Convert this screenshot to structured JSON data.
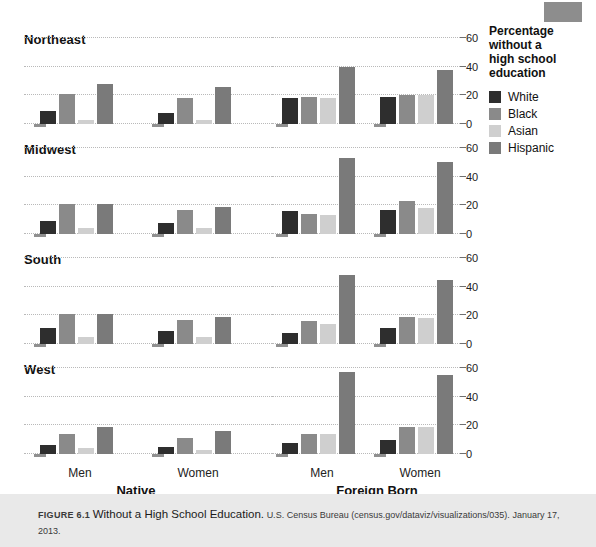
{
  "legend": {
    "title_lines": [
      "Percentage",
      "without a",
      "high school",
      "education"
    ],
    "items": [
      {
        "label": "White",
        "color": "#2e2e2e"
      },
      {
        "label": "Black",
        "color": "#8a8a8a"
      },
      {
        "label": "Asian",
        "color": "#cfcfcf"
      },
      {
        "label": "Hispanic",
        "color": "#7a7a7a"
      }
    ]
  },
  "caption": {
    "figure_number": "FIGURE 6.1",
    "title": "Without a High School Education.",
    "source": "U.S. Census Bureau (census.gov/dataviz/visualizations/035).",
    "date": "January 17, 2013."
  },
  "axis": {
    "ticks": [
      0,
      20,
      40,
      60
    ],
    "ymin": 0,
    "ymax": 60
  },
  "group_labels": {
    "native": "Native",
    "foreign": "Foreign Born",
    "men": "Men",
    "women": "Women"
  },
  "regions": [
    {
      "name": "Northeast"
    },
    {
      "name": "Midwest"
    },
    {
      "name": "South"
    },
    {
      "name": "West"
    }
  ],
  "chart_data": {
    "type": "bar",
    "title": "Without a High School Education",
    "subtitle": "Percentage without a high school education",
    "xlabel": "",
    "ylabel": "Percentage without a high school education",
    "ylim": [
      0,
      60
    ],
    "yticks": [
      0,
      20,
      40,
      60
    ],
    "grid": true,
    "legend_position": "right",
    "series_names": [
      "White",
      "Black",
      "Asian",
      "Hispanic"
    ],
    "series_colors": [
      "#2e2e2e",
      "#8a8a8a",
      "#cfcfcf",
      "#7a7a7a"
    ],
    "facet_rows": [
      "Northeast",
      "Midwest",
      "South",
      "West"
    ],
    "facet_cols": [
      "Native",
      "Foreign Born"
    ],
    "categories": [
      "Men",
      "Women"
    ],
    "panels": [
      {
        "region": "Northeast",
        "nativity": "Native",
        "groups": [
          {
            "category": "Men",
            "values": [
              9,
              21,
              3,
              28
            ]
          },
          {
            "category": "Women",
            "values": [
              8,
              18,
              3,
              26
            ]
          }
        ]
      },
      {
        "region": "Northeast",
        "nativity": "Foreign Born",
        "groups": [
          {
            "category": "Men",
            "values": [
              18,
              19,
              18,
              40
            ]
          },
          {
            "category": "Women",
            "values": [
              19,
              20,
              20,
              38
            ]
          }
        ]
      },
      {
        "region": "Midwest",
        "nativity": "Native",
        "groups": [
          {
            "category": "Men",
            "values": [
              9,
              21,
              4,
              21
            ]
          },
          {
            "category": "Women",
            "values": [
              8,
              17,
              4,
              19
            ]
          }
        ]
      },
      {
        "region": "Midwest",
        "nativity": "Foreign Born",
        "groups": [
          {
            "category": "Men",
            "values": [
              16,
              14,
              13,
              53
            ]
          },
          {
            "category": "Women",
            "values": [
              17,
              23,
              18,
              50
            ]
          }
        ]
      },
      {
        "region": "South",
        "nativity": "Native",
        "groups": [
          {
            "category": "Men",
            "values": [
              11,
              21,
              5,
              21
            ]
          },
          {
            "category": "Women",
            "values": [
              9,
              17,
              5,
              19
            ]
          }
        ]
      },
      {
        "region": "South",
        "nativity": "Foreign Born",
        "groups": [
          {
            "category": "Men",
            "values": [
              8,
              16,
              14,
              48
            ]
          },
          {
            "category": "Women",
            "values": [
              11,
              19,
              18,
              45
            ]
          }
        ]
      },
      {
        "region": "West",
        "nativity": "Native",
        "groups": [
          {
            "category": "Men",
            "values": [
              6,
              14,
              4,
              19
            ]
          },
          {
            "category": "Women",
            "values": [
              5,
              11,
              3,
              16
            ]
          }
        ]
      },
      {
        "region": "West",
        "nativity": "Foreign Born",
        "groups": [
          {
            "category": "Men",
            "values": [
              8,
              14,
              14,
              57
            ]
          },
          {
            "category": "Women",
            "values": [
              10,
              19,
              19,
              55
            ]
          }
        ]
      }
    ]
  }
}
